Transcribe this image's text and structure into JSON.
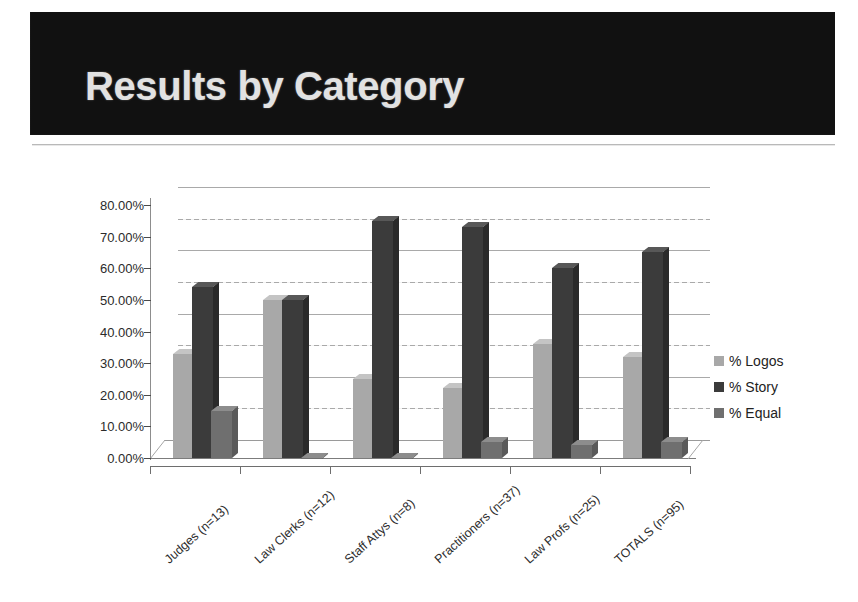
{
  "slide": {
    "title": "Results by Category"
  },
  "legend": {
    "position": "right",
    "items": [
      {
        "label": "% Logos",
        "color": "#a8a8a8",
        "swatch_icon": "square-swatch-icon"
      },
      {
        "label": "% Story",
        "color": "#3b3b3b",
        "swatch_icon": "square-swatch-icon"
      },
      {
        "label": "% Equal",
        "color": "#6f6f6f",
        "swatch_icon": "square-swatch-icon"
      }
    ]
  },
  "chart_data": {
    "type": "bar",
    "title": "Results by Category",
    "xlabel": "",
    "ylabel": "",
    "ylim": [
      0,
      80
    ],
    "grid": true,
    "legend_position": "right",
    "ytick_labels": [
      "80.00%",
      "70.00%",
      "60.00%",
      "50.00%",
      "40.00%",
      "30.00%",
      "20.00%",
      "10.00%",
      "0.00%"
    ],
    "yticks": [
      80,
      70,
      60,
      50,
      40,
      30,
      20,
      10,
      0
    ],
    "categories": [
      "Judges (n=13)",
      "Law Clerks (n=12)",
      "Staff Attys (n=8)",
      "Practitioners (n=37)",
      "Law Profs (n=25)",
      "TOTALS (n=95)"
    ],
    "series": [
      {
        "name": "% Logos",
        "color": "#a8a8a8",
        "values": [
          33,
          50,
          25,
          22,
          36,
          32
        ]
      },
      {
        "name": "% Story",
        "color": "#3b3b3b",
        "values": [
          54,
          50,
          75,
          73,
          60,
          65
        ]
      },
      {
        "name": "% Equal",
        "color": "#6f6f6f",
        "values": [
          15,
          0,
          0,
          5,
          4,
          5
        ]
      }
    ]
  }
}
